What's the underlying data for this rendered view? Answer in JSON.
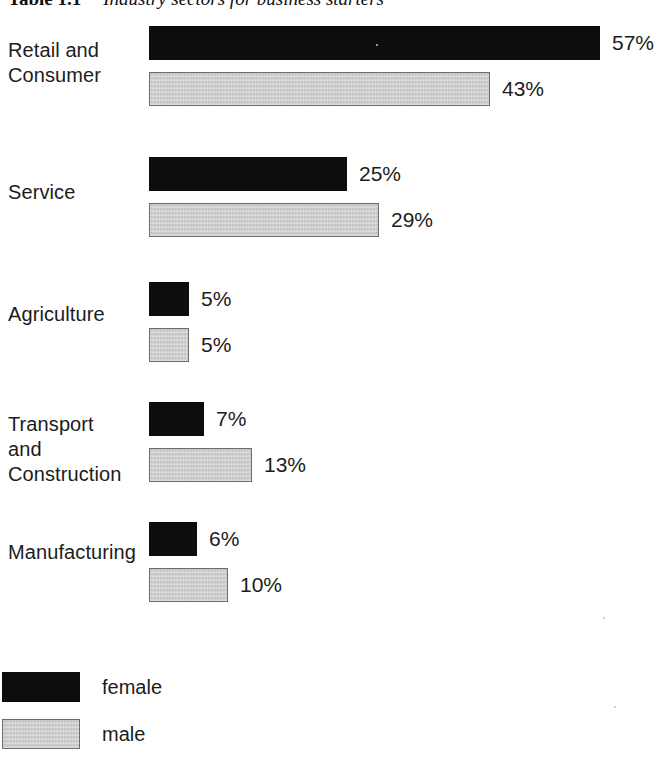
{
  "title": {
    "label": "Table 1.1",
    "text": "Industry sectors for business starters"
  },
  "chart_data": {
    "type": "bar",
    "orientation": "horizontal",
    "xlabel": "",
    "ylabel": "",
    "grid": false,
    "axis_visible": false,
    "value_suffix": "%",
    "xlim": [
      0,
      60
    ],
    "legend_position": "bottom-left",
    "categories": [
      "Retail and\nConsumer",
      "Service",
      "Agriculture",
      "Transport\nand\nConstruction",
      "Manufacturing"
    ],
    "series": [
      {
        "name": "female",
        "color": "#0d0d0d",
        "values": [
          57,
          25,
          5,
          7,
          6
        ],
        "labels": [
          "57%",
          "25%",
          "5%",
          "7%",
          "6%"
        ]
      },
      {
        "name": "male",
        "color": "#c9c9c9",
        "values": [
          43,
          29,
          5,
          13,
          10
        ],
        "labels": [
          "43%",
          "29%",
          "5%",
          "13%",
          "10%"
        ]
      }
    ]
  },
  "legend": [
    {
      "name": "female",
      "color": "#0d0d0d"
    },
    {
      "name": "male",
      "color": "#c9c9c9"
    }
  ]
}
